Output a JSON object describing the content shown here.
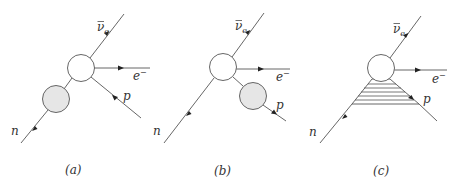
{
  "figure": {
    "panels": [
      {
        "id": "a",
        "caption": "(a)",
        "labels": {
          "n": "n",
          "nu": "ν",
          "nu_sub": "e",
          "e": "e",
          "e_sup": "−",
          "p": "p"
        },
        "insertion": "gray blob on incoming neutron line"
      },
      {
        "id": "b",
        "caption": "(b)",
        "labels": {
          "n": "n",
          "nu": "ν",
          "nu_sub": "e",
          "e": "e",
          "e_sup": "−",
          "p": "p"
        },
        "insertion": "gray blob on outgoing proton line"
      },
      {
        "id": "c",
        "caption": "(c)",
        "labels": {
          "n": "n",
          "nu": "ν",
          "nu_sub": "e",
          "e": "e",
          "e_sup": "−",
          "p": "p"
        },
        "insertion": "hatched triangle connecting neutron and proton lines"
      }
    ],
    "colors": {
      "line": "#555555",
      "blob_gray": "#e6e6e6",
      "blob_white": "#ffffff"
    }
  }
}
